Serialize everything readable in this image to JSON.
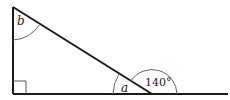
{
  "diagram": {
    "type": "geometry-triangle",
    "labels": {
      "angle_top": "b",
      "angle_inner": "a",
      "angle_exterior": "140°"
    },
    "right_angle_marker": true,
    "colors": {
      "line": "#1a1a1a",
      "arc": "#555555",
      "text": "#222222"
    }
  }
}
